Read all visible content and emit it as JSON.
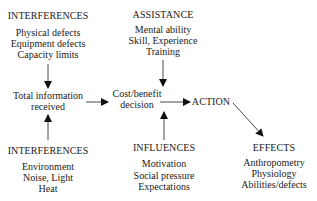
{
  "diagram": {
    "interferences_top": {
      "title": "INTERFERENCES",
      "items": [
        "Physical defects",
        "Equipment defects",
        "Capacity limits"
      ]
    },
    "assistance": {
      "title": "ASSISTANCE",
      "items": [
        "Mental ability",
        "Skill, Experience",
        "Training"
      ]
    },
    "total_information": {
      "line1": "Total information",
      "line2": "received"
    },
    "decision": {
      "line1": "Cost/benefit",
      "line2": "decision"
    },
    "action": {
      "title": "ACTION"
    },
    "interferences_bottom": {
      "title": "INTERFERENCES",
      "items": [
        "Environment",
        "Noise, Light",
        "Heat"
      ]
    },
    "influences": {
      "title": "INFLUENCES",
      "items": [
        "Motivation",
        "Social pressure",
        "Expectations"
      ]
    },
    "effects": {
      "title": "EFFECTS",
      "items": [
        "Anthropometry",
        "Physiology",
        "Abilities/defects"
      ]
    },
    "edges": [
      {
        "from": "interferences_top",
        "to": "total_information"
      },
      {
        "from": "interferences_bottom",
        "to": "total_information"
      },
      {
        "from": "total_information",
        "to": "decision"
      },
      {
        "from": "assistance",
        "to": "decision"
      },
      {
        "from": "influences",
        "to": "decision"
      },
      {
        "from": "decision",
        "to": "action"
      },
      {
        "from": "action",
        "to": "effects"
      }
    ],
    "colors": {
      "text": "#1a1a1a",
      "line": "#333333",
      "background": "#ffffff"
    }
  }
}
